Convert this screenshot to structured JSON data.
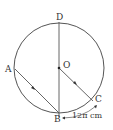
{
  "diagram": {
    "points": {
      "D": "D",
      "O": "O",
      "A": "A",
      "B": "B",
      "C": "C"
    },
    "arc_label": "12π cm",
    "colors": {
      "stroke": "#555555",
      "text": "#333333"
    }
  }
}
